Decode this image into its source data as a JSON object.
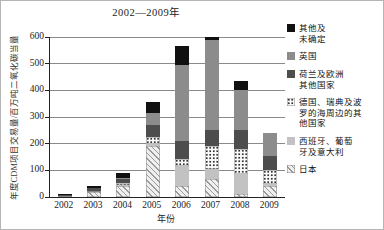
{
  "figure": {
    "title": "2002—2009年",
    "x_axis_label": "年份",
    "y_axis_label": "年度CDM项目交易量/百万吨二氧化碳当量"
  },
  "chart_data": {
    "type": "bar",
    "stacked": true,
    "title": "2002—2009年",
    "xlabel": "年份",
    "ylabel": "年度CDM项目交易量/百万吨二氧化碳当量",
    "ylim": [
      0,
      600
    ],
    "yticks": [
      0,
      100,
      200,
      300,
      400,
      500,
      600
    ],
    "grid": true,
    "legend_position": "right",
    "categories": [
      "2002",
      "2003",
      "2004",
      "2005",
      "2006",
      "2007",
      "2008",
      "2009"
    ],
    "series": [
      {
        "key": "japan",
        "name": "日本",
        "legend_label": "日本",
        "pattern": "diagonal-hatch",
        "color": "#efefef",
        "values": [
          3,
          18,
          40,
          190,
          41,
          66,
          10,
          40
        ]
      },
      {
        "key": "spain",
        "name": "西班牙、葡萄牙及意大利",
        "legend_label": "西班牙、葡萄\n牙及意大利",
        "pattern": "solid",
        "color": "#c2c2c2",
        "values": [
          0,
          0,
          5,
          8,
          75,
          38,
          75,
          10
        ]
      },
      {
        "key": "germany",
        "name": "德国、瑞典及波罗的海周边的其他国家",
        "legend_label": "德国、瑞典及波\n罗的海周边的其\n他国家",
        "pattern": "dots",
        "color": "#fcfcfc",
        "values": [
          0,
          4,
          8,
          27,
          25,
          87,
          94,
          50
        ]
      },
      {
        "key": "netherlands",
        "name": "荷兰及欧洲其他国家",
        "legend_label": "荷兰及欧洲\n其他国家",
        "pattern": "solid",
        "color": "#4d4d4d",
        "values": [
          4,
          10,
          14,
          45,
          69,
          59,
          71,
          52
        ]
      },
      {
        "key": "uk",
        "name": "英国",
        "legend_label": "英国",
        "pattern": "solid",
        "color": "#8c8c8c",
        "values": [
          0,
          0,
          5,
          45,
          286,
          338,
          153,
          88
        ]
      },
      {
        "key": "other",
        "name": "其他及未确定",
        "legend_label": "其他及\n未确定",
        "pattern": "solid",
        "color": "#111111",
        "values": [
          3,
          10,
          18,
          40,
          69,
          12,
          32,
          0
        ]
      }
    ]
  }
}
